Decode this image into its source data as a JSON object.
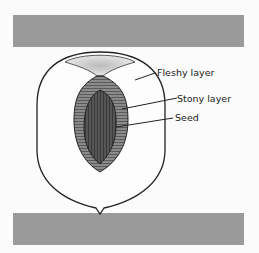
{
  "diagram": {
    "labels": {
      "fleshy": "Fleshy layer",
      "stony": "Stony layer",
      "seed": "Seed"
    },
    "colors": {
      "bars": "#9a9a9a",
      "outline": "#222222",
      "stony_layer": "#7a7a7a",
      "seed": "#4e4e4e"
    }
  }
}
